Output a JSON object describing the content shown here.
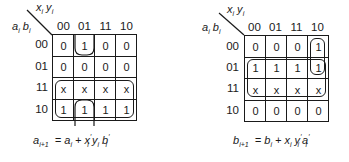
{
  "maps": [
    {
      "id": "a",
      "col_var_label": "x_i y_i",
      "row_var_label": "a_i b_i",
      "col_labels": [
        "00",
        "01",
        "11",
        "10"
      ],
      "row_labels": [
        "00",
        "01",
        "11",
        "10"
      ],
      "cells": [
        [
          "0",
          "1",
          "0",
          "0"
        ],
        [
          "0",
          "0",
          "0",
          "0"
        ],
        [
          "x",
          "x",
          "x",
          "x"
        ],
        [
          "1",
          "1",
          "1",
          "1"
        ]
      ],
      "formula": {
        "lhs": "a",
        "lhs_sub": "i+1",
        "rhs": "= a_i + x'_i y_i b'_i"
      },
      "groupings": [
        {
          "name": "rows 11 and 10 (a_i)",
          "rows": [
            2,
            3
          ],
          "cols": [
            0,
            1,
            2,
            3
          ]
        },
        {
          "name": "column 01, rows 00 and 10 wrap (x'_i y_i b'_i)",
          "rows": [
            0,
            3
          ],
          "cols": [
            1
          ]
        }
      ]
    },
    {
      "id": "b",
      "col_var_label": "x_i y_i",
      "row_var_label": "a_i b_i",
      "col_labels": [
        "00",
        "01",
        "11",
        "10"
      ],
      "row_labels": [
        "00",
        "01",
        "11",
        "10"
      ],
      "cells": [
        [
          "0",
          "0",
          "0",
          "1"
        ],
        [
          "1",
          "1",
          "1",
          "1"
        ],
        [
          "x",
          "x",
          "x",
          "x"
        ],
        [
          "0",
          "0",
          "0",
          "0"
        ]
      ],
      "formula": {
        "lhs": "b",
        "lhs_sub": "i+1",
        "rhs": "= b_i + x_i y'_i a'_i"
      },
      "groupings": [
        {
          "name": "rows 01 and 11 (b_i)",
          "rows": [
            1,
            2
          ],
          "cols": [
            0,
            1,
            2,
            3
          ]
        },
        {
          "name": "column 10, rows 00 and 01 (x_i y'_i a'_i)",
          "rows": [
            0,
            1
          ],
          "cols": [
            3
          ]
        }
      ]
    }
  ]
}
